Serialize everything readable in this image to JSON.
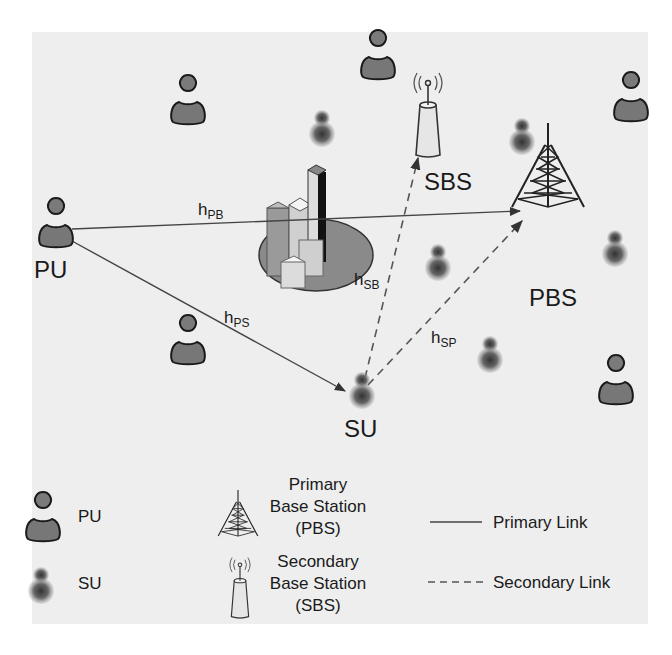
{
  "colors": {
    "panel_bg": "#eeeeee",
    "user_fill": "#777777",
    "user_stroke": "#1a1a1a",
    "su_fill": "#666666",
    "line": "#444444",
    "text": "#1a1a1a"
  },
  "nodes": {
    "pu_main": "PU",
    "su_main": "SU",
    "sbs": "SBS",
    "pbs": "PBS"
  },
  "links": {
    "h_pb": {
      "base": "h",
      "sub": "PB"
    },
    "h_ps": {
      "base": "h",
      "sub": "PS"
    },
    "h_sb": {
      "base": "h",
      "sub": "SB"
    },
    "h_sp": {
      "base": "h",
      "sub": "SP"
    }
  },
  "legend": {
    "pu": "PU",
    "su": "SU",
    "pbs": [
      "Primary",
      "Base Station",
      "(PBS)"
    ],
    "sbs": [
      "Secondary",
      "Base Station",
      "(SBS)"
    ],
    "primary_link": "Primary Link",
    "secondary_link": "Secondary Link"
  }
}
